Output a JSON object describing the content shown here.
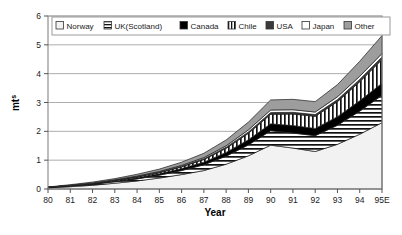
{
  "chart_data": {
    "type": "area",
    "stacked": true,
    "title": "",
    "xlabel": "Year",
    "ylabel": "mt",
    "ylabel_sup": "s",
    "ylim": [
      0,
      6
    ],
    "yticks": [
      0,
      1,
      2,
      3,
      4,
      5,
      6
    ],
    "ytick_labels": [
      "0",
      "1",
      "2",
      "3",
      "4",
      "5",
      "6"
    ],
    "grid": true,
    "legend_position": "top-inside",
    "categories": [
      "80",
      "81",
      "82",
      "83",
      "84",
      "85",
      "86",
      "87",
      "88",
      "89",
      "90",
      "91",
      "92",
      "93",
      "94",
      "95E"
    ],
    "series": [
      {
        "name": "Norway",
        "fill": "#f2f2f2",
        "pattern": "solid-light",
        "values": [
          0.04,
          0.08,
          0.13,
          0.2,
          0.28,
          0.38,
          0.5,
          0.64,
          0.86,
          1.15,
          1.52,
          1.42,
          1.3,
          1.55,
          1.9,
          2.3
        ]
      },
      {
        "name": "UK(Scotland)",
        "fill": "#ffffff",
        "pattern": "horizontal",
        "values": [
          0.01,
          0.02,
          0.03,
          0.05,
          0.07,
          0.1,
          0.14,
          0.2,
          0.28,
          0.38,
          0.5,
          0.52,
          0.55,
          0.66,
          0.8,
          0.95
        ]
      },
      {
        "name": "Canada",
        "fill": "#000000",
        "pattern": "solid",
        "values": [
          0.01,
          0.01,
          0.02,
          0.03,
          0.04,
          0.05,
          0.07,
          0.09,
          0.13,
          0.18,
          0.24,
          0.26,
          0.25,
          0.3,
          0.36,
          0.42
        ]
      },
      {
        "name": "Chile",
        "fill": "#ffffff",
        "pattern": "vertical",
        "values": [
          0.0,
          0.01,
          0.01,
          0.02,
          0.03,
          0.04,
          0.06,
          0.09,
          0.14,
          0.22,
          0.33,
          0.4,
          0.42,
          0.52,
          0.66,
          0.82
        ]
      },
      {
        "name": "USA",
        "fill": "#3a3a3a",
        "pattern": "solid",
        "values": [
          0.0,
          0.0,
          0.01,
          0.01,
          0.01,
          0.02,
          0.02,
          0.03,
          0.04,
          0.05,
          0.06,
          0.06,
          0.06,
          0.07,
          0.08,
          0.09
        ]
      },
      {
        "name": "Japan",
        "fill": "#ffffff",
        "pattern": "solid-white",
        "values": [
          0.0,
          0.01,
          0.01,
          0.01,
          0.02,
          0.02,
          0.03,
          0.04,
          0.05,
          0.07,
          0.09,
          0.09,
          0.09,
          0.1,
          0.11,
          0.12
        ]
      },
      {
        "name": "Other",
        "fill": "#9d9d9d",
        "pattern": "solid-gray",
        "values": [
          0.01,
          0.02,
          0.03,
          0.04,
          0.06,
          0.08,
          0.11,
          0.15,
          0.2,
          0.27,
          0.35,
          0.36,
          0.36,
          0.42,
          0.52,
          0.62
        ]
      }
    ],
    "totals": [
      0.07,
      0.15,
      0.24,
      0.36,
      0.51,
      0.69,
      0.93,
      1.24,
      1.7,
      2.32,
      3.09,
      3.11,
      3.03,
      3.62,
      4.43,
      5.32
    ]
  },
  "legend": {
    "items": [
      {
        "label": "Norway"
      },
      {
        "label": "UK(Scotland)"
      },
      {
        "label": "Canada"
      },
      {
        "label": "Chile"
      },
      {
        "label": "USA"
      },
      {
        "label": "Japan"
      },
      {
        "label": "Other"
      }
    ]
  }
}
